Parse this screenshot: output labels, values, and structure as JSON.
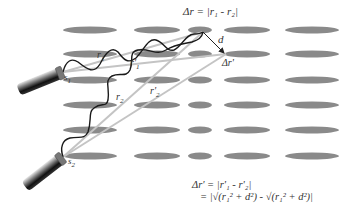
{
  "diagram": {
    "colors": {
      "ellipse": "#8a8a8a",
      "wave": "#1a1a1a",
      "ray": "#bdbdbd",
      "arrow": "#222222",
      "text": "#333333"
    },
    "lattice": {
      "rows_y": [
        30,
        54,
        80,
        105,
        130,
        156
      ],
      "columns": [
        {
          "cx": 90,
          "rx": 27
        },
        {
          "cx": 157,
          "rx": 23
        },
        {
          "cx": 200,
          "rx": 12
        },
        {
          "cx": 247,
          "rx": 23
        },
        {
          "cx": 312,
          "rx": 27
        }
      ],
      "ry": 3.5
    },
    "sources": [
      {
        "id": "s1",
        "label": "s",
        "sub": "1",
        "x": 63,
        "y": 72
      },
      {
        "id": "s2",
        "label": "s",
        "sub": "2",
        "x": 63,
        "y": 157
      }
    ],
    "points": {
      "delta_r": {
        "x": 203,
        "y": 32
      },
      "delta_r_prime": {
        "x": 226,
        "y": 54
      }
    },
    "labels": {
      "r1": {
        "text": "r",
        "sub": "1"
      },
      "r1_prime": {
        "text": "r'",
        "sub": "1"
      },
      "r2": {
        "text": "r",
        "sub": "2"
      },
      "r2_prime": {
        "text": "r'",
        "sub": "2"
      },
      "d": "d",
      "delta_r_prime": "Δr'",
      "top_equation": "Δr = |r₁ - r₂|"
    },
    "bottom_equation": {
      "line1": "Δr' = |r'₁ - r'₂|",
      "line2": "= |√(r₁² + d²)  - √(r₁² + d²)|"
    }
  }
}
